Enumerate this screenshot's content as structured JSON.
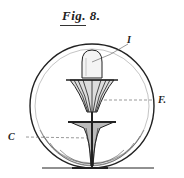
{
  "figure": {
    "title": "Fig. 8.",
    "labels": {
      "top": "I",
      "right": "F.",
      "left": "C"
    }
  },
  "colors": {
    "ink": "#222222",
    "paper": "#ffffff"
  }
}
